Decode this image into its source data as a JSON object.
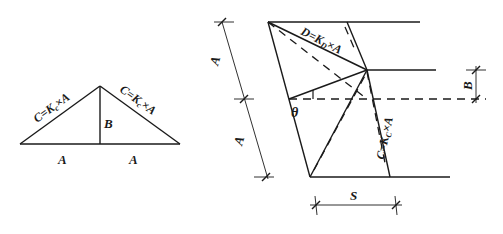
{
  "left_figure": {
    "slope_label_left": "C=K",
    "slope_label_left_sub": "c",
    "slope_label_left_tail": "×A",
    "slope_label_right": "C=K",
    "slope_label_right_sub": "c",
    "slope_label_right_tail": "×A",
    "height_label": "B",
    "base_label_left": "A",
    "base_label_right": "A"
  },
  "right_figure": {
    "diagonal_label": "D=K",
    "diagonal_label_sub": "D",
    "diagonal_label_tail": "×A",
    "slope_label": "C=K",
    "slope_label_sub": "C",
    "slope_label_tail": "×A",
    "dim_upper_label": "A",
    "dim_lower_label": "A",
    "dim_right_label": "B",
    "dim_bottom_label": "S",
    "angle_label": "θ"
  },
  "colors": {
    "line": "#1a1a1a",
    "background": "#ffffff"
  }
}
